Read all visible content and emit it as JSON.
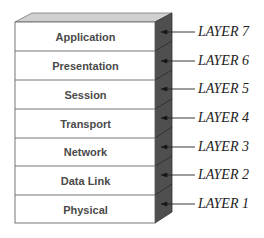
{
  "diagram": {
    "layers": [
      {
        "name": "Application",
        "tag": "LAYER 7"
      },
      {
        "name": "Presentation",
        "tag": "LAYER 6"
      },
      {
        "name": "Session",
        "tag": "LAYER 5"
      },
      {
        "name": "Transport",
        "tag": "LAYER 4"
      },
      {
        "name": "Network",
        "tag": "LAYER 3"
      },
      {
        "name": "Data Link",
        "tag": "LAYER 2"
      },
      {
        "name": "Physical",
        "tag": "LAYER 1"
      }
    ],
    "colors": {
      "front_face": "#ffffff",
      "top_face": "#cfcfcf",
      "side_face": "#4d4d4d",
      "edge": "#555555",
      "arrow": "#222222"
    }
  }
}
